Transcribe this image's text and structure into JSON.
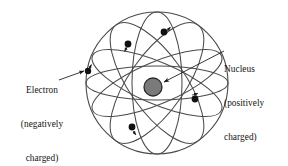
{
  "figure": {
    "background_color": "#ffffff",
    "line_color": "#4a4a4a",
    "electron_color": "#111111",
    "nucleus_fill": "#7a7a7a",
    "nucleus_stroke": "#2b2b2b",
    "text_color": "#141414"
  },
  "labels": {
    "electron": {
      "line1": "Electron",
      "line2": "(negatively",
      "line3": "charged)",
      "full_text": "Electron (negatively charged)"
    },
    "nucleus": {
      "line1": "Nucleus",
      "line2": "(positively",
      "line3": "charged)",
      "full_text": "Nucleus (positively charged)"
    }
  },
  "geometry": {
    "sphere": {
      "cx": 157,
      "cy": 83,
      "r": 71
    },
    "nucleus": {
      "cx": 153,
      "cy": 87,
      "r": 9
    },
    "orbits": [
      {
        "name": "equatorial-orbit",
        "rx": 71,
        "ry": 17,
        "rotate": 0
      },
      {
        "name": "polar-orbit",
        "rx": 25,
        "ry": 71,
        "rotate": 0
      },
      {
        "name": "tilted-orbit-1",
        "rx": 28,
        "ry": 71,
        "rotate": 35
      },
      {
        "name": "tilted-orbit-2",
        "rx": 28,
        "ry": 71,
        "rotate": -35
      },
      {
        "name": "tilted-orbit-3",
        "rx": 22,
        "ry": 70,
        "rotate": 66
      },
      {
        "name": "tilted-orbit-4",
        "rx": 22,
        "ry": 70,
        "rotate": -66
      }
    ],
    "electrons": [
      {
        "name": "electron-left",
        "cx": 88,
        "cy": 71,
        "r": 3.2
      },
      {
        "name": "electron-upper-left",
        "cx": 128,
        "cy": 44,
        "r": 3.4
      },
      {
        "name": "electron-top",
        "cx": 164,
        "cy": 32,
        "r": 3.4
      },
      {
        "name": "electron-right",
        "cx": 195,
        "cy": 99,
        "r": 3.4
      },
      {
        "name": "electron-bottom-left",
        "cx": 132,
        "cy": 127,
        "r": 3.4
      }
    ],
    "leaders": [
      {
        "name": "electron-leader-line",
        "x1": 61,
        "y1": 79,
        "x2": 85,
        "y2": 71
      },
      {
        "name": "nucleus-leader-line",
        "x1": 223,
        "y1": 52,
        "x2": 164,
        "y2": 82
      }
    ]
  }
}
